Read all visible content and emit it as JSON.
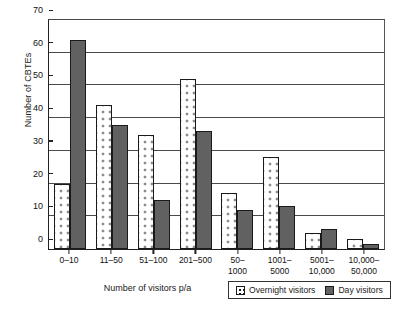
{
  "chart_data": {
    "type": "bar",
    "title": "",
    "xlabel": "Number of visitors p/a",
    "ylabel": "Number of CBTEs",
    "ylim": [
      0,
      70
    ],
    "yticks": [
      0,
      10,
      20,
      30,
      40,
      50,
      60,
      70
    ],
    "grid": true,
    "legend_position": "bottom-right",
    "categories": [
      "0–10",
      "11–50",
      "51–100",
      "201–500",
      "50–\n1000",
      "1001–\n5000",
      "5001–\n10,000",
      "10,000–\n50,000"
    ],
    "category_lines": [
      [
        "0–10",
        ""
      ],
      [
        "11–50",
        ""
      ],
      [
        "51–100",
        ""
      ],
      [
        "201–500",
        ""
      ],
      [
        "50–",
        "1000"
      ],
      [
        "1001–",
        "5000"
      ],
      [
        "5001–",
        "10,000"
      ],
      [
        "10,000–",
        "50,000"
      ]
    ],
    "series": [
      {
        "name": "Overnight visitors",
        "color": "#ffffff",
        "pattern": "dotted",
        "values": [
          20,
          44,
          35,
          52,
          17,
          28,
          5,
          3
        ]
      },
      {
        "name": "Day visitors",
        "color": "#616161",
        "pattern": "solid",
        "values": [
          64,
          38,
          15,
          36,
          12,
          13,
          6,
          1.5
        ]
      }
    ]
  },
  "legend": {
    "items": [
      {
        "label": "Overnight visitors",
        "swatch": "overnight"
      },
      {
        "label": "Day visitors",
        "swatch": "day"
      }
    ]
  }
}
